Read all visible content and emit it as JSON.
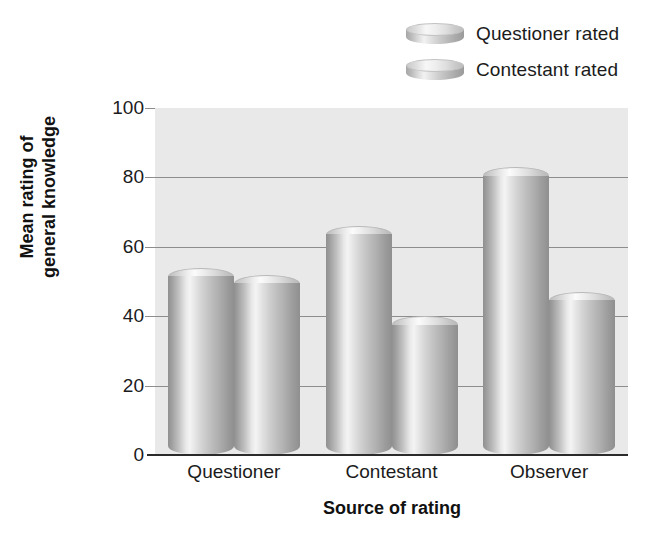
{
  "chart_data": {
    "type": "bar",
    "title": "",
    "xlabel": "Source of rating",
    "ylabel": "Mean rating of general knowledge",
    "ylabel_line1": "Mean rating of",
    "ylabel_line2": "general knowledge",
    "categories": [
      "Questioner",
      "Contestant",
      "Observer"
    ],
    "series": [
      {
        "name": "Questioner rated",
        "values": [
          54,
          66,
          83
        ]
      },
      {
        "name": "Contestant rated",
        "values": [
          52,
          40,
          47
        ]
      }
    ],
    "ylim": [
      0,
      100
    ],
    "yticks": [
      0,
      20,
      40,
      60,
      80,
      100
    ],
    "ytick_labels": [
      "0",
      "20",
      "40",
      "60",
      "80",
      "100"
    ],
    "grid": "horizontal",
    "legend_position": "top-right",
    "bar_style": "cylinder",
    "colors": {
      "plot_background": "#e9e9e9",
      "gridline": "#8d8d8d",
      "axis": "#2b2b2b",
      "bar_light": "#f4f4f4",
      "bar_dark": "#8f8f8f",
      "text": "#1b1b1b"
    }
  },
  "legend": {
    "items": [
      {
        "label": "Questioner rated",
        "swatch": "cylinder-swatch"
      },
      {
        "label": "Contestant rated",
        "swatch": "cylinder-swatch"
      }
    ]
  },
  "axes": {
    "y_title_line1": "Mean rating of",
    "y_title_line2": "general knowledge",
    "x_title": "Source of rating",
    "y_tick_0": "0",
    "y_tick_20": "20",
    "y_tick_40": "40",
    "y_tick_60": "60",
    "y_tick_80": "80",
    "y_tick_100": "100",
    "x_tick_1": "Questioner",
    "x_tick_2": "Contestant",
    "x_tick_3": "Observer"
  }
}
